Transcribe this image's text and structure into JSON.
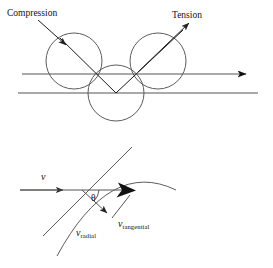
{
  "figure": {
    "background_color": "#ffffff",
    "width": 273,
    "height": 268,
    "stroke_color": "#4a4a4a",
    "text_color": "#111111"
  },
  "top_diagram": {
    "name": "compression-tension-circles",
    "labels": {
      "compression": "Compression",
      "tension": "Tension"
    },
    "circles": [
      {
        "name": "circle-left",
        "cx": 74,
        "cy": 61,
        "r": 28
      },
      {
        "name": "circle-right",
        "cx": 158,
        "cy": 61,
        "r": 28
      },
      {
        "name": "circle-bottom",
        "cx": 116,
        "cy": 93,
        "r": 28
      }
    ],
    "lines": [
      {
        "name": "upper-flow-line",
        "x1": 22,
        "y1": 74,
        "x2": 252,
        "y2": 74,
        "arrow": "right"
      },
      {
        "name": "lower-flow-line",
        "x1": 18,
        "y1": 93,
        "x2": 258,
        "y2": 93,
        "arrow": "none"
      }
    ],
    "arrows": {
      "compression": {
        "x1": 41,
        "y1": 22,
        "x2": 70,
        "y2": 48,
        "direction": "down-right"
      },
      "tension": {
        "x1": 116,
        "y1": 93,
        "x2": 189,
        "y2": 24,
        "direction": "up-right"
      }
    },
    "diagonals": [
      {
        "name": "compression-diagonal",
        "x1": 63,
        "y1": 41,
        "x2": 116,
        "y2": 93
      },
      {
        "name": "tension-diagonal",
        "x1": 116,
        "y1": 93,
        "x2": 178,
        "y2": 36
      }
    ]
  },
  "bottom_diagram": {
    "name": "velocity-decomposition",
    "labels": {
      "v": "v",
      "theta": "θ",
      "v_radial_var": "v",
      "v_radial_sub": "radial",
      "v_tangential_var": "v",
      "v_tangential_sub": "tangential"
    },
    "origin": {
      "x": 82,
      "y": 190
    },
    "vectors": [
      {
        "name": "v-incoming",
        "x1": 20,
        "y1": 190,
        "x2": 131,
        "y2": 190,
        "label": "v"
      },
      {
        "name": "v-radial",
        "x1": 82,
        "y1": 190,
        "x2": 112,
        "y2": 218,
        "label": "v_radial"
      },
      {
        "name": "v-tangential",
        "x1": 112,
        "y1": 218,
        "x2": 133,
        "y2": 192,
        "label": "v_tangential"
      }
    ],
    "tangent_line": {
      "name": "tangent-line",
      "x1": 42,
      "y1": 237,
      "x2": 131,
      "y2": 148
    },
    "arc": {
      "name": "surface-arc",
      "start_x": 57,
      "start_y": 256,
      "ctrl_x": 110,
      "ctrl_y": 160,
      "end_x": 176,
      "end_y": 188
    },
    "angle": {
      "name": "theta-angle",
      "value_symbol": "θ",
      "between": [
        "v-incoming",
        "v-radial"
      ]
    }
  }
}
